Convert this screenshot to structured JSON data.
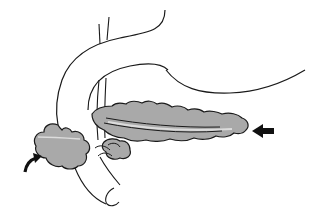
{
  "diagram": {
    "labels": [],
    "colors": {
      "background": "#ffffff",
      "outline": "#1a1a1a",
      "gland_fill": "#a9a9a9",
      "duct_highlight": "#dcdcdc",
      "arrow": "#111111"
    },
    "parts": [
      {
        "id": "outer-loop",
        "description": "large outer curved tube outline"
      },
      {
        "id": "inner-loop",
        "description": "inner curved tube outline (duodenal loop)"
      },
      {
        "id": "vessels",
        "description": "paired vertical vessel lines"
      },
      {
        "id": "pancreas-body-tail",
        "description": "gray lobulated gland body and tail with duct"
      },
      {
        "id": "pancreas-head",
        "description": "gray lobulated head mass at lower left"
      },
      {
        "id": "uncinate-lobule",
        "description": "small gray lobule below the neck"
      },
      {
        "id": "lower-tube",
        "description": "descending tube outline ending in curled end"
      }
    ],
    "arrows": [
      {
        "id": "curved-arrow",
        "position": "lower-left",
        "points_to": "pancreas head"
      },
      {
        "id": "straight-arrow",
        "position": "right",
        "direction": "left",
        "points_to": "pancreas tail"
      }
    ]
  }
}
